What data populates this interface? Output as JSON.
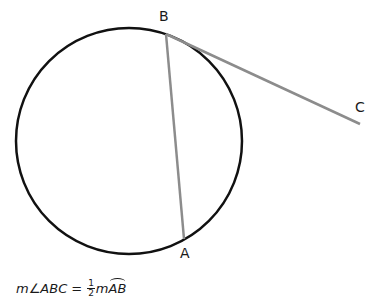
{
  "diagram": {
    "circle": {
      "cx": 129,
      "cy": 141,
      "r": 113,
      "stroke": "#111111"
    },
    "points": {
      "A": {
        "label": "A",
        "x": 184,
        "y": 239
      },
      "B": {
        "label": "B",
        "x": 166,
        "y": 34
      },
      "C": {
        "label": "C",
        "x": 360,
        "y": 124
      }
    },
    "segments": [
      {
        "from": "B",
        "to": "A",
        "stroke": "#8c8c8c",
        "role": "chord"
      },
      {
        "from": "B",
        "to": "C",
        "stroke": "#8c8c8c",
        "role": "tangent"
      }
    ]
  },
  "formula": {
    "lhs": "m∠ABC",
    "equals": "=",
    "frac_num": "1",
    "frac_den": "2",
    "m": "m",
    "arc": "AB"
  }
}
